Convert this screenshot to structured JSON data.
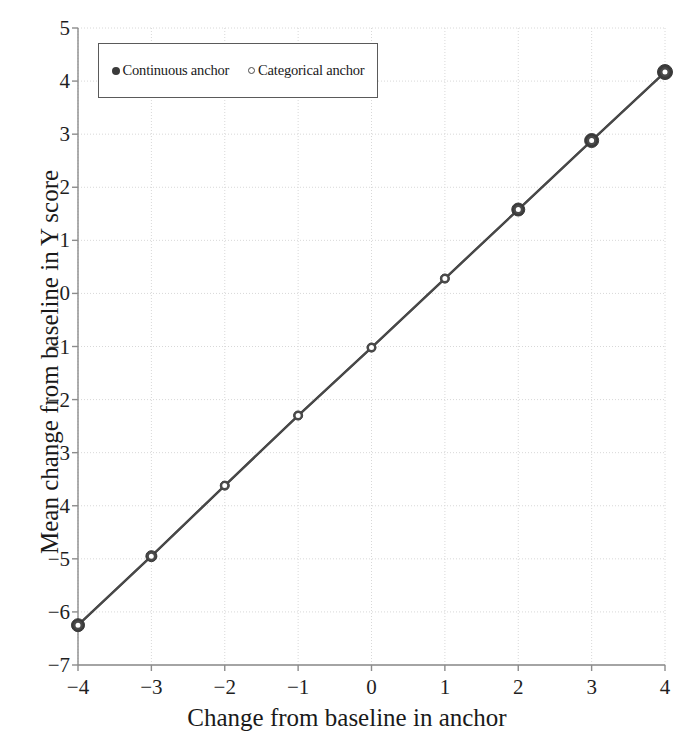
{
  "chart_data": {
    "type": "line",
    "title": "",
    "xlabel": "Change from baseline in anchor",
    "ylabel": "Mean change from baseline in Y score",
    "x": [
      -4,
      -3,
      -2,
      -1,
      0,
      1,
      2,
      3,
      4
    ],
    "xlim": [
      -4,
      4
    ],
    "ylim": [
      -7,
      5
    ],
    "xticks": [
      "-4",
      "-3",
      "-2",
      "-1",
      "0",
      "1",
      "2",
      "3",
      "4"
    ],
    "yticks": [
      "5",
      "4",
      "3",
      "2",
      "1",
      "0",
      "-1",
      "-2",
      "-3",
      "-4",
      "-5",
      "-6",
      "-7"
    ],
    "grid": true,
    "legend_position": "top-left",
    "series": [
      {
        "name": "Continuous anchor",
        "marker": "filled-circle",
        "color": "#3a3a3a",
        "values": [
          -6.25,
          -4.95,
          -3.62,
          -2.3,
          -1.02,
          0.28,
          1.58,
          2.88,
          4.17
        ]
      },
      {
        "name": "Categorical anchor",
        "marker": "open-circle",
        "color": "#4a4a4a",
        "values": [
          -6.25,
          -4.95,
          -3.62,
          -2.3,
          -1.02,
          0.28,
          1.58,
          2.88,
          4.17
        ]
      }
    ]
  },
  "legend": {
    "entries": [
      {
        "label": "Continuous anchor",
        "marker": "filled-circle-icon"
      },
      {
        "label": "Categorical anchor",
        "marker": "open-circle-icon"
      }
    ]
  },
  "axes": {
    "x_title": "Change from baseline in anchor",
    "y_title": "Mean change from baseline in Y score",
    "x_tick_labels": [
      "−4",
      "−3",
      "−2",
      "−1",
      "0",
      "1",
      "2",
      "3",
      "4"
    ],
    "y_tick_labels": [
      "5",
      "4",
      "3",
      "2",
      "1",
      "0",
      "−1",
      "−2",
      "−3",
      "−4",
      "−5",
      "−6",
      "−7"
    ]
  },
  "colors": {
    "background": "#ffffff",
    "grid": "#d8d8d8",
    "axis": "#8c8c8c",
    "line": "#3a3a3a",
    "text": "#1a1a1a",
    "legend_border": "#5a5a5a"
  }
}
